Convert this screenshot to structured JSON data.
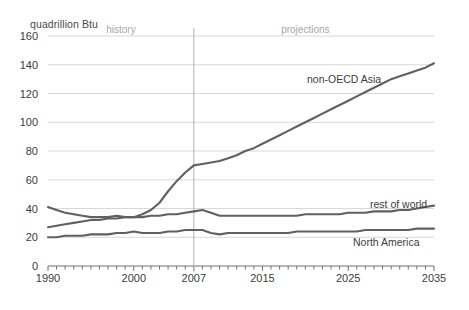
{
  "chart_data": {
    "type": "line",
    "title": "",
    "ylabel": "quadrillion Btu",
    "xlabel": "",
    "ylim": [
      0,
      160
    ],
    "xlim": [
      1990,
      2035
    ],
    "yticks": [
      0,
      20,
      40,
      60,
      80,
      100,
      120,
      140,
      160
    ],
    "xticks": [
      1990,
      2000,
      2007,
      2015,
      2025,
      2035
    ],
    "grid": "horizontal",
    "legend": "inline-labels",
    "annotations": [
      {
        "text": "history",
        "x": 1998.5,
        "y": 160
      },
      {
        "text": "projections",
        "x": 2020,
        "y": 160
      }
    ],
    "divider_x": 2007,
    "line_color": "#606060",
    "grid_color": "#d8d8d8",
    "x": [
      1990,
      1991,
      1992,
      1993,
      1994,
      1995,
      1996,
      1997,
      1998,
      1999,
      2000,
      2001,
      2002,
      2003,
      2004,
      2005,
      2006,
      2007,
      2008,
      2009,
      2010,
      2011,
      2012,
      2013,
      2014,
      2015,
      2016,
      2017,
      2018,
      2019,
      2020,
      2021,
      2022,
      2023,
      2024,
      2025,
      2026,
      2027,
      2028,
      2029,
      2030,
      2031,
      2032,
      2033,
      2034,
      2035
    ],
    "series": [
      {
        "name": "non-OECD Asia",
        "values": [
          27,
          28,
          29,
          30,
          31,
          32,
          32,
          33,
          33,
          34,
          34,
          36,
          39,
          44,
          52,
          59,
          65,
          70,
          71,
          72,
          73,
          75,
          77,
          80,
          82,
          85,
          88,
          91,
          94,
          97,
          100,
          103,
          106,
          109,
          112,
          115,
          118,
          121,
          124,
          127,
          130,
          132,
          134,
          136,
          138,
          141
        ]
      },
      {
        "name": "rest of world",
        "values": [
          41,
          39,
          37,
          36,
          35,
          34,
          34,
          34,
          35,
          34,
          34,
          34,
          35,
          35,
          36,
          36,
          37,
          38,
          39,
          37,
          35,
          35,
          35,
          35,
          35,
          35,
          35,
          35,
          35,
          35,
          36,
          36,
          36,
          36,
          36,
          37,
          37,
          37,
          38,
          38,
          38,
          39,
          39,
          40,
          41,
          42
        ]
      },
      {
        "name": "North America",
        "values": [
          20,
          20,
          21,
          21,
          21,
          22,
          22,
          22,
          23,
          23,
          24,
          23,
          23,
          23,
          24,
          24,
          25,
          25,
          25,
          23,
          22,
          23,
          23,
          23,
          23,
          23,
          23,
          23,
          23,
          24,
          24,
          24,
          24,
          24,
          24,
          24,
          24,
          25,
          25,
          25,
          25,
          25,
          25,
          26,
          26,
          26
        ]
      }
    ],
    "series_label_positions": [
      {
        "name": "non-OECD Asia",
        "left": 307,
        "top": 73
      },
      {
        "name": "rest of world",
        "left": 370,
        "top": 198
      },
      {
        "name": "North America",
        "left": 353,
        "top": 236
      }
    ]
  }
}
